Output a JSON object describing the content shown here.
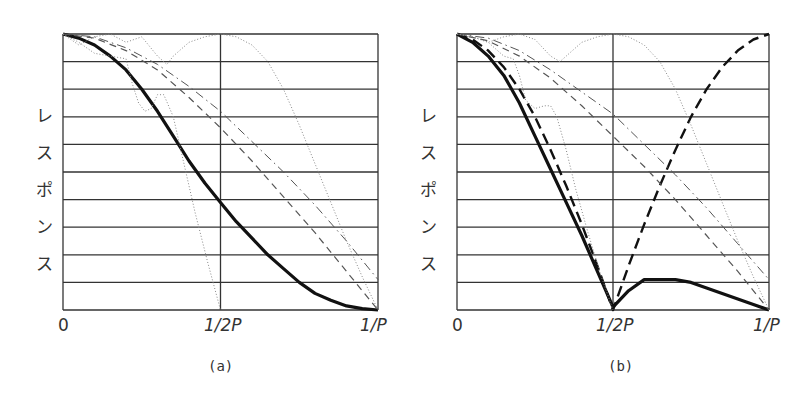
{
  "chart_data": [
    {
      "id": "a",
      "type": "line",
      "caption": "(a)",
      "ylabel": "レスポンス",
      "ylabel_chars": [
        "レ",
        "ス",
        "ポ",
        "ン",
        "ス"
      ],
      "x_ticks": [
        "0",
        "1/2P",
        "1/P"
      ],
      "xlim": [
        0,
        1
      ],
      "ylim": [
        0,
        1
      ],
      "grid": {
        "horizontal_lines": 11,
        "vertical_lines_at": [
          0,
          0.5,
          1
        ]
      },
      "series": [
        {
          "name": "solid-thick",
          "style": "solid",
          "width": 3.2,
          "x": [
            0,
            0.05,
            0.1,
            0.15,
            0.2,
            0.25,
            0.3,
            0.35,
            0.4,
            0.45,
            0.5,
            0.55,
            0.6,
            0.65,
            0.7,
            0.75,
            0.8,
            0.85,
            0.9,
            0.95,
            1.0
          ],
          "y": [
            1.0,
            0.985,
            0.96,
            0.92,
            0.87,
            0.8,
            0.72,
            0.63,
            0.54,
            0.46,
            0.39,
            0.32,
            0.26,
            0.2,
            0.15,
            0.1,
            0.06,
            0.035,
            0.015,
            0.005,
            0.0
          ]
        },
        {
          "name": "dashed",
          "style": "dashed",
          "width": 1.2,
          "x": [
            0,
            0.1,
            0.2,
            0.3,
            0.4,
            0.5,
            0.6,
            0.7,
            0.8,
            0.9,
            1.0
          ],
          "y": [
            1.0,
            0.985,
            0.94,
            0.87,
            0.77,
            0.66,
            0.54,
            0.41,
            0.28,
            0.14,
            0.0
          ]
        },
        {
          "name": "dash-dot",
          "style": "dashdot",
          "width": 1.0,
          "x": [
            0,
            0.1,
            0.2,
            0.3,
            0.4,
            0.5,
            0.6,
            0.7,
            0.8,
            0.9,
            1.0
          ],
          "y": [
            1.0,
            0.99,
            0.95,
            0.89,
            0.81,
            0.72,
            0.61,
            0.5,
            0.38,
            0.25,
            0.11
          ]
        },
        {
          "name": "dotted-wide",
          "style": "dotted",
          "width": 1.0,
          "x": [
            0,
            0.05,
            0.1,
            0.15,
            0.2,
            0.25,
            0.3,
            0.33,
            0.35,
            0.4,
            0.45,
            0.5,
            0.55,
            0.6,
            0.65,
            0.7,
            0.75,
            0.8,
            0.85,
            0.9,
            0.95,
            1.0
          ],
          "y": [
            1.0,
            0.96,
            0.99,
            1.0,
            0.97,
            0.99,
            0.92,
            0.89,
            0.92,
            0.97,
            0.99,
            1.0,
            0.99,
            0.96,
            0.9,
            0.8,
            0.67,
            0.53,
            0.39,
            0.25,
            0.12,
            0.0
          ]
        },
        {
          "name": "dotted-narrow",
          "style": "dotted",
          "width": 1.0,
          "x": [
            0,
            0.05,
            0.1,
            0.15,
            0.2,
            0.22,
            0.24,
            0.26,
            0.28,
            0.3,
            0.32,
            0.35,
            0.38,
            0.42,
            0.46,
            0.5
          ],
          "y": [
            1.0,
            0.97,
            0.93,
            0.92,
            0.91,
            0.82,
            0.75,
            0.72,
            0.73,
            0.78,
            0.78,
            0.7,
            0.55,
            0.35,
            0.17,
            0.0
          ]
        }
      ]
    },
    {
      "id": "b",
      "type": "line",
      "caption": "(b)",
      "ylabel": "レスポンス",
      "ylabel_chars": [
        "レ",
        "ス",
        "ポ",
        "ン",
        "ス"
      ],
      "x_ticks": [
        "0",
        "1/2P",
        "1/P"
      ],
      "xlim": [
        0,
        1
      ],
      "ylim": [
        0,
        1
      ],
      "grid": {
        "horizontal_lines": 11,
        "vertical_lines_at": [
          0,
          0.5,
          1
        ]
      },
      "series": [
        {
          "name": "solid-thick",
          "style": "solid",
          "width": 3.2,
          "x": [
            0,
            0.05,
            0.1,
            0.15,
            0.2,
            0.25,
            0.3,
            0.35,
            0.4,
            0.45,
            0.5,
            0.55,
            0.6,
            0.62,
            0.65,
            0.7,
            0.75,
            0.8,
            0.85,
            0.9,
            0.95,
            1.0
          ],
          "y": [
            1.0,
            0.97,
            0.92,
            0.85,
            0.75,
            0.63,
            0.51,
            0.39,
            0.27,
            0.14,
            0.01,
            0.07,
            0.11,
            0.11,
            0.11,
            0.11,
            0.1,
            0.08,
            0.06,
            0.04,
            0.02,
            0.0
          ]
        },
        {
          "name": "long-dashed-thick",
          "style": "longdash",
          "width": 2.4,
          "x": [
            0,
            0.05,
            0.1,
            0.15,
            0.2,
            0.25,
            0.3,
            0.35,
            0.4,
            0.45,
            0.5,
            0.55,
            0.6,
            0.65,
            0.7,
            0.75,
            0.8,
            0.85,
            0.9,
            0.95,
            1.0
          ],
          "y": [
            1.0,
            0.98,
            0.94,
            0.88,
            0.8,
            0.7,
            0.58,
            0.45,
            0.31,
            0.16,
            0.0,
            0.16,
            0.31,
            0.45,
            0.58,
            0.7,
            0.8,
            0.88,
            0.94,
            0.98,
            1.0
          ]
        },
        {
          "name": "dashed",
          "style": "dashed",
          "width": 1.2,
          "x": [
            0,
            0.1,
            0.2,
            0.3,
            0.4,
            0.5,
            0.6,
            0.7,
            0.8,
            0.9,
            1.0
          ],
          "y": [
            1.0,
            0.975,
            0.92,
            0.84,
            0.74,
            0.63,
            0.52,
            0.4,
            0.27,
            0.14,
            0.0
          ]
        },
        {
          "name": "dash-dot",
          "style": "dashdot",
          "width": 1.0,
          "x": [
            0,
            0.1,
            0.2,
            0.3,
            0.4,
            0.5,
            0.6,
            0.7,
            0.8,
            0.9,
            1.0
          ],
          "y": [
            1.0,
            0.985,
            0.94,
            0.87,
            0.79,
            0.71,
            0.6,
            0.49,
            0.37,
            0.24,
            0.11
          ]
        },
        {
          "name": "dotted-wide",
          "style": "dotted",
          "width": 1.0,
          "x": [
            0,
            0.05,
            0.1,
            0.15,
            0.2,
            0.25,
            0.3,
            0.33,
            0.35,
            0.4,
            0.45,
            0.5,
            0.55,
            0.6,
            0.65,
            0.7,
            0.75,
            0.8,
            0.85,
            0.9,
            0.95,
            1.0
          ],
          "y": [
            1.0,
            0.99,
            0.97,
            0.99,
            1.0,
            0.98,
            0.92,
            0.9,
            0.92,
            0.97,
            0.99,
            1.0,
            0.99,
            0.96,
            0.9,
            0.8,
            0.67,
            0.53,
            0.39,
            0.25,
            0.12,
            0.0
          ]
        },
        {
          "name": "dotted-narrow",
          "style": "dotted",
          "width": 1.0,
          "x": [
            0,
            0.05,
            0.1,
            0.15,
            0.18,
            0.2,
            0.22,
            0.25,
            0.28,
            0.3,
            0.32,
            0.35,
            0.38,
            0.42,
            0.46,
            0.5
          ],
          "y": [
            1.0,
            0.99,
            0.97,
            0.92,
            0.91,
            0.85,
            0.76,
            0.73,
            0.74,
            0.74,
            0.7,
            0.58,
            0.44,
            0.28,
            0.13,
            0.0
          ]
        }
      ]
    }
  ]
}
